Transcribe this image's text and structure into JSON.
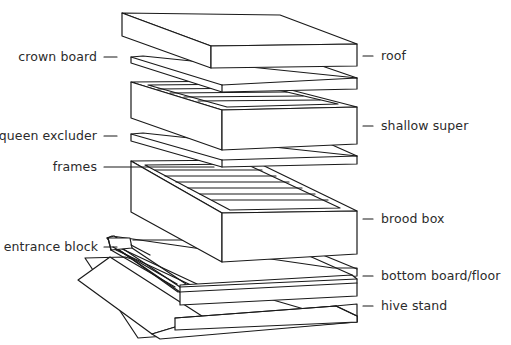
{
  "diagram": {
    "type": "exploded-view",
    "line_color": "#1a1a1a",
    "text_color": "#2b2b2b",
    "background": "#ffffff",
    "labels_left": [
      {
        "id": "crown-board",
        "text": "crown board"
      },
      {
        "id": "queen-excluder",
        "text": "queen excluder"
      },
      {
        "id": "frames",
        "text": "frames"
      },
      {
        "id": "entrance-block",
        "text": "entrance block"
      }
    ],
    "labels_right": [
      {
        "id": "roof",
        "text": "roof"
      },
      {
        "id": "shallow-super",
        "text": "shallow super"
      },
      {
        "id": "brood-box",
        "text": "brood box"
      },
      {
        "id": "bottom-board",
        "text": "bottom board/floor"
      },
      {
        "id": "hive-stand",
        "text": "hive stand"
      }
    ]
  }
}
